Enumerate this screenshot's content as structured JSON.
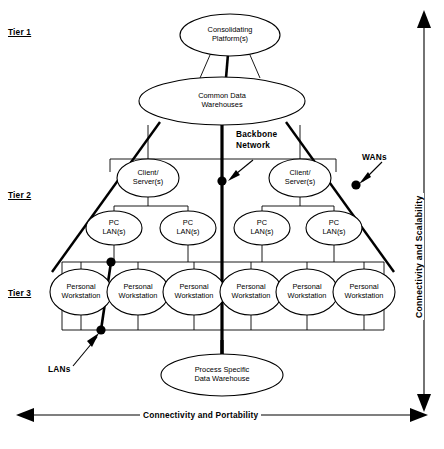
{
  "diagram": {
    "tiers": [
      {
        "id": "tier1",
        "label": "Tier 1"
      },
      {
        "id": "tier2",
        "label": "Tier 2"
      },
      {
        "id": "tier3",
        "label": "Tier 3"
      }
    ],
    "nodes": [
      {
        "id": "consolidating-platform",
        "label": "Consolidating\nPlatform(s)",
        "tier": "tier1",
        "cx": 230,
        "cy": 35,
        "rx": 50,
        "ry": 21
      },
      {
        "id": "common-data-warehouses",
        "label": "Common Data\nWarehouses",
        "tier": "tier1",
        "cx": 222,
        "cy": 101,
        "rx": 83,
        "ry": 24
      },
      {
        "id": "client-server-left",
        "label": "Client/\nServer(s)",
        "tier": "tier2",
        "cx": 148,
        "cy": 178,
        "rx": 31,
        "ry": 19
      },
      {
        "id": "client-server-right",
        "label": "Client/\nServer(s)",
        "tier": "tier2",
        "cx": 300,
        "cy": 178,
        "rx": 31,
        "ry": 19
      },
      {
        "id": "pc-lan-1",
        "label": "PC\nLAN(s)",
        "tier": "tier2",
        "cx": 114,
        "cy": 228,
        "rx": 28,
        "ry": 17
      },
      {
        "id": "pc-lan-2",
        "label": "PC\nLAN(s)",
        "tier": "tier2",
        "cx": 188,
        "cy": 228,
        "rx": 28,
        "ry": 17
      },
      {
        "id": "pc-lan-3",
        "label": "PC\nLAN(s)",
        "tier": "tier2",
        "cx": 262,
        "cy": 228,
        "rx": 28,
        "ry": 17
      },
      {
        "id": "pc-lan-4",
        "label": "PC\nLAN(s)",
        "tier": "tier2",
        "cx": 334,
        "cy": 228,
        "rx": 28,
        "ry": 17
      },
      {
        "id": "personal-workstation-1",
        "label": "Personal\nWorkstation",
        "tier": "tier3",
        "cx": 81,
        "cy": 292,
        "rx": 31,
        "ry": 23
      },
      {
        "id": "personal-workstation-2",
        "label": "Personal\nWorkstation",
        "tier": "tier3",
        "cx": 138,
        "cy": 292,
        "rx": 31,
        "ry": 23
      },
      {
        "id": "personal-workstation-3",
        "label": "Personal\nWorkstation",
        "tier": "tier3",
        "cx": 194,
        "cy": 292,
        "rx": 31,
        "ry": 23
      },
      {
        "id": "personal-workstation-4",
        "label": "Personal\nWorkstation",
        "tier": "tier3",
        "cx": 251,
        "cy": 292,
        "rx": 31,
        "ry": 23
      },
      {
        "id": "personal-workstation-5",
        "label": "Personal\nWorkstation",
        "tier": "tier3",
        "cx": 307,
        "cy": 292,
        "rx": 31,
        "ry": 23
      },
      {
        "id": "personal-workstation-6",
        "label": "Personal\nWorkstation",
        "tier": "tier3",
        "cx": 364,
        "cy": 292,
        "rx": 31,
        "ry": 23
      },
      {
        "id": "process-specific-data-warehouse",
        "label": "Process Specific\nData Warehouse",
        "tier": "base",
        "cx": 222,
        "cy": 375,
        "rx": 61,
        "ry": 21
      }
    ],
    "annotations": [
      {
        "id": "backbone-network",
        "label": "Backbone\nNetwork"
      },
      {
        "id": "wans",
        "label": "WANs"
      },
      {
        "id": "lans",
        "label": "LANs"
      }
    ],
    "axes": [
      {
        "id": "axis-bottom",
        "label": "Connectivity and Portability",
        "orientation": "horizontal",
        "arrows": "both"
      },
      {
        "id": "axis-right",
        "label": "Connectivity and Scalability",
        "orientation": "vertical",
        "arrows": "both"
      }
    ]
  }
}
